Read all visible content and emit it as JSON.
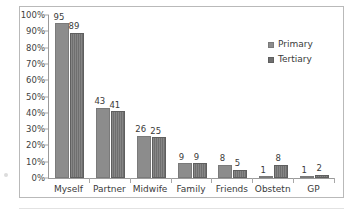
{
  "chart_data": {
    "type": "bar",
    "title": "",
    "subtitle": "",
    "xlabel": "",
    "ylabel": "",
    "ylim": [
      0,
      100
    ],
    "yticks": [
      "0%",
      "10%",
      "20%",
      "30%",
      "40%",
      "50%",
      "60%",
      "70%",
      "80%",
      "90%",
      "100%"
    ],
    "ytick_values": [
      0,
      10,
      20,
      30,
      40,
      50,
      60,
      70,
      80,
      90,
      100
    ],
    "grid": false,
    "legend_position": "upper right",
    "categories": [
      "Myself",
      "Partner",
      "Midwife",
      "Family",
      "Friends",
      "Obstetn",
      "GP"
    ],
    "series": [
      {
        "name": "Primary",
        "color": "#8c8c8c",
        "values": [
          95,
          43,
          26,
          9,
          8,
          1,
          1
        ],
        "labels": [
          "95",
          "43",
          "26",
          "9",
          "8",
          "1",
          "1"
        ]
      },
      {
        "name": "Tertiary",
        "color": "#6f6f6f",
        "values": [
          89,
          41,
          25,
          9,
          5,
          8,
          2
        ],
        "labels": [
          "89",
          "41",
          "25",
          "9",
          "5",
          "8",
          "2"
        ]
      }
    ]
  },
  "legend": {
    "items": [
      {
        "label": "Primary",
        "swatch": "legend-swatch-primary"
      },
      {
        "label": "Tertiary",
        "swatch": "legend-swatch-tertiary"
      }
    ]
  }
}
